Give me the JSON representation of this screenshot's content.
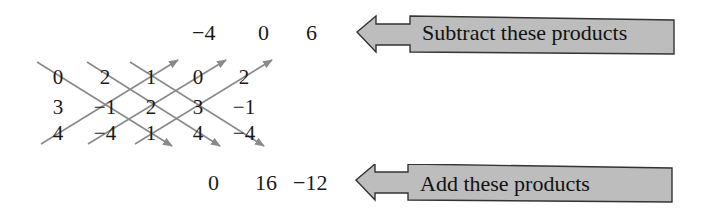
{
  "top_products": [
    "−4",
    "0",
    "6"
  ],
  "bottom_products": [
    "0",
    "16",
    "−12"
  ],
  "matrix": {
    "rows": [
      [
        "0",
        "2",
        "1",
        "0",
        "2"
      ],
      [
        "3",
        "−1",
        "2",
        "3",
        "−1"
      ],
      [
        "4",
        "−4",
        "1",
        "4",
        "−4"
      ]
    ]
  },
  "callouts": {
    "subtract": "Subtract these products",
    "add": "Add these products"
  },
  "colors": {
    "line": "#8a8a8a",
    "callout_fill": "#bdbdbd",
    "callout_stroke": "#333333"
  }
}
